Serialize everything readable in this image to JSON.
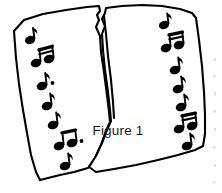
{
  "figure": {
    "caption": "Figure 1",
    "background_color": "#ffffff",
    "ink_color": "#000000",
    "caption_color": "#1a1a1a"
  },
  "paper": {
    "name": "torn-paper-sheet",
    "fill_color": "#ffffff",
    "outline_color": "#000000",
    "outline_width": 2.1,
    "tear": {
      "name": "vertical-tear",
      "description": "ragged rip descending from the top edge to roughly two thirds down the sheet",
      "start_y": 8,
      "end_y": 122
    }
  },
  "notes": {
    "left_column_count": 8,
    "right_column_count": 8,
    "glyph_color": "#000000",
    "left_column": [
      {
        "id": "L1",
        "type": "eighth-note",
        "x": 31,
        "y": 36
      },
      {
        "id": "L2",
        "type": "beamed-eighth-pair",
        "x": 38,
        "y": 54
      },
      {
        "id": "L3",
        "type": "dotted-eighth-note",
        "x": 44,
        "y": 77
      },
      {
        "id": "L4",
        "type": "eighth-note",
        "x": 49,
        "y": 97
      },
      {
        "id": "L5",
        "type": "eighth-note",
        "x": 54,
        "y": 114
      },
      {
        "id": "L6",
        "type": "beamed-eighth-pair-dotted",
        "x": 60,
        "y": 133
      },
      {
        "id": "L7",
        "type": "eighth-note",
        "x": 65,
        "y": 154
      },
      {
        "id": "L8",
        "type": "eighth-note",
        "x": 32,
        "y": 44
      }
    ],
    "right_column": [
      {
        "id": "R1",
        "type": "eighth-note",
        "x": 166,
        "y": 22
      },
      {
        "id": "R2",
        "type": "beamed-eighth-pair",
        "x": 170,
        "y": 40
      },
      {
        "id": "R3",
        "type": "eighth-note",
        "x": 176,
        "y": 62
      },
      {
        "id": "R4",
        "type": "eighth-note",
        "x": 179,
        "y": 81
      },
      {
        "id": "R5",
        "type": "eighth-note",
        "x": 183,
        "y": 99
      },
      {
        "id": "R6",
        "type": "beamed-eighth-pair",
        "x": 186,
        "y": 117
      },
      {
        "id": "R7",
        "type": "eighth-note",
        "x": 189,
        "y": 137
      },
      {
        "id": "R8",
        "type": "eighth-note",
        "x": 180,
        "y": 72
      }
    ]
  },
  "caption_position": {
    "x": 118,
    "y": 135
  },
  "scan_artifacts": {
    "present": true,
    "description": "faint illegible grey specks along the far right edge from an adjacent page",
    "color": "#c9c9c9"
  }
}
